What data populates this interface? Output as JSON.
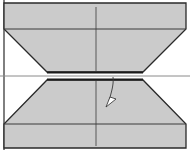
{
  "diagram": {
    "type": "folding-instruction",
    "width": 190,
    "height": 152,
    "colors": {
      "background": "#ffffff",
      "paper_fill": "#cbcbcb",
      "outline": "#2a2a2a",
      "crease": "#3a3a3a",
      "center_line": "#8a8a8a",
      "arrowhead_fill": "#ffffff"
    },
    "shapes": {
      "top_panel": {
        "points": [
          [
            4,
            3
          ],
          [
            186,
            3
          ],
          [
            186,
            29
          ],
          [
            143,
            72
          ],
          [
            47,
            72
          ],
          [
            4,
            29
          ]
        ],
        "crease_y": 29,
        "vertical_crease_x": 96
      },
      "bottom_panel": {
        "points": [
          [
            47,
            80
          ],
          [
            143,
            80
          ],
          [
            186,
            124
          ],
          [
            186,
            148
          ],
          [
            4,
            148
          ],
          [
            4,
            124
          ]
        ],
        "crease_y": 124,
        "vertical_crease_x": 96
      },
      "center_line_y": 76,
      "left_border_x": 4
    },
    "arrow": {
      "meaning": "fold-direction-arrow",
      "path_start": [
        113,
        77
      ],
      "path_end": [
        110,
        100
      ],
      "head_tip": [
        106,
        106
      ]
    }
  }
}
